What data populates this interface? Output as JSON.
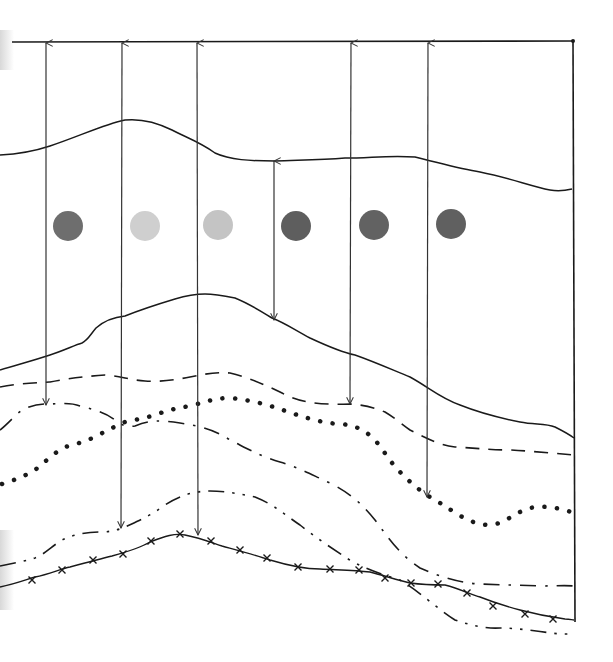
{
  "diagram": {
    "title": "",
    "frame": {
      "top_y": 42,
      "right_x": 574,
      "bottom_y": 622,
      "left_x": 0
    },
    "arrows": [
      {
        "id": "arrow-1",
        "x": 46,
        "y_from": 405,
        "y_to": 42
      },
      {
        "id": "arrow-2",
        "x": 121,
        "y_from": 528,
        "y_to": 42
      },
      {
        "id": "arrow-3",
        "x": 197,
        "y_from": 535,
        "y_to": 42
      },
      {
        "id": "arrow-4",
        "x": 274,
        "y_from": 320,
        "y_to": 160
      },
      {
        "id": "arrow-5",
        "x": 350,
        "y_from": 404,
        "y_to": 42
      },
      {
        "id": "arrow-6",
        "x": 427,
        "y_from": 497,
        "y_to": 42
      }
    ],
    "markers": [
      {
        "id": "circle-1",
        "cx": 68,
        "cy": 226,
        "r": 15,
        "color": "#6e6e6e"
      },
      {
        "id": "circle-2",
        "cx": 145,
        "cy": 226,
        "r": 15,
        "color": "#cfcfcf"
      },
      {
        "id": "circle-3",
        "cx": 218,
        "cy": 225,
        "r": 15,
        "color": "#c4c4c4"
      },
      {
        "id": "circle-4",
        "cx": 296,
        "cy": 226,
        "r": 15,
        "color": "#5e5e5e"
      },
      {
        "id": "circle-5",
        "cx": 374,
        "cy": 225,
        "r": 15,
        "color": "#626262"
      },
      {
        "id": "circle-6",
        "cx": 451,
        "cy": 224,
        "r": 15,
        "color": "#606060"
      }
    ],
    "curves": [
      {
        "id": "upper-solid-curve",
        "style": "solid"
      },
      {
        "id": "middle-solid-curve",
        "style": "solid"
      },
      {
        "id": "long-dash-curve",
        "style": "dashed"
      },
      {
        "id": "dash-dot-curve-upper",
        "style": "dash-dot"
      },
      {
        "id": "dotted-curve",
        "style": "dotted"
      },
      {
        "id": "dash-dot-curve-lower",
        "style": "dash-dot"
      },
      {
        "id": "cross-marked-curve",
        "style": "solid-with-x-markers"
      }
    ],
    "colors": {
      "ink": "#1a1a1a",
      "arrow": "#333333",
      "paper": "#ffffff"
    }
  }
}
